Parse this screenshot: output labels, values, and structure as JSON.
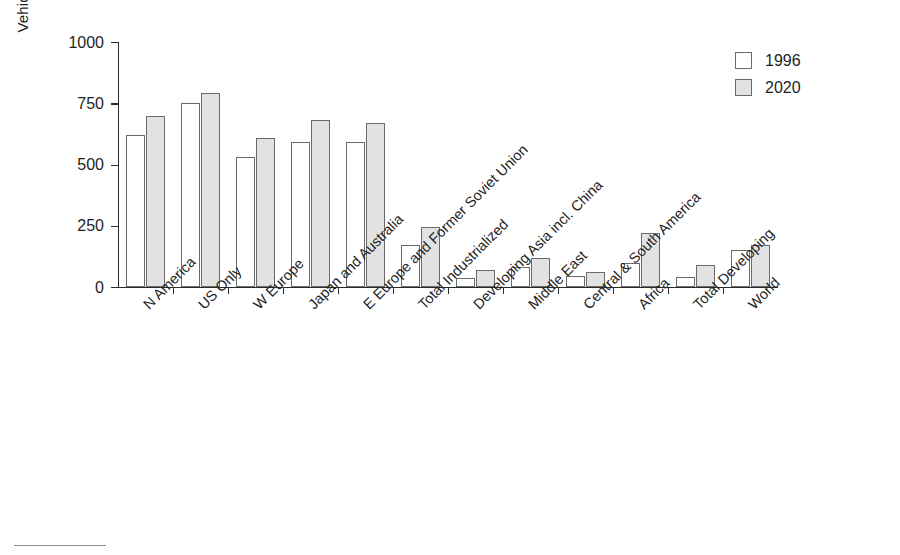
{
  "chart_data": {
    "type": "bar",
    "title": "",
    "xlabel": "",
    "ylabel": "Vehicles per 1000 people",
    "ylim": [
      0,
      1000
    ],
    "yticks": [
      0,
      250,
      500,
      750,
      1000
    ],
    "ytick_labels": [
      "0",
      "250",
      "500",
      "750",
      "1000"
    ],
    "grid": false,
    "legend_position": "top-right",
    "categories": [
      "N America",
      "US Only",
      "W Europe",
      "Japan and Australia",
      "E Europe and Former Soviet Union",
      "Total Industrialized",
      "Developing Asia incl. China",
      "Middle East",
      "Central & South America",
      "Africa",
      "Total Developing",
      "World"
    ],
    "series": [
      {
        "name": "1996",
        "color": "#ffffff",
        "values": [
          620,
          750,
          530,
          590,
          590,
          170,
          35,
          80,
          45,
          100,
          40,
          150
        ]
      },
      {
        "name": "2020",
        "color": "#e2e2e2",
        "values": [
          700,
          790,
          610,
          680,
          670,
          245,
          70,
          120,
          60,
          220,
          90,
          170
        ]
      }
    ]
  },
  "legend": {
    "entries": [
      {
        "label": "1996",
        "swatch": "white-square-icon"
      },
      {
        "label": "2020",
        "swatch": "gray-square-icon"
      }
    ]
  }
}
